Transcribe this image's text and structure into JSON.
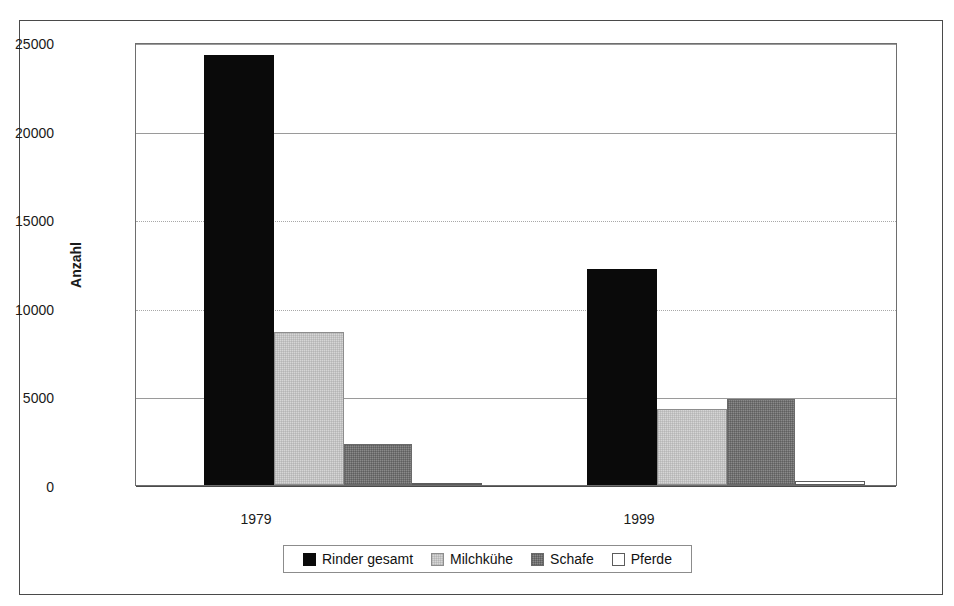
{
  "chart_data": {
    "type": "bar",
    "title": "",
    "subtitle": "",
    "xlabel": "",
    "ylabel": "Anzahl",
    "categories": [
      "1979",
      "1999"
    ],
    "series": [
      {
        "name": "Rinder gesamt",
        "values": [
          24400,
          12250
        ],
        "color": "#0a0a0a"
      },
      {
        "name": "Milchkühe",
        "values": [
          8650,
          4300
        ],
        "color": "#d6d6d6"
      },
      {
        "name": "Schafe",
        "values": [
          2300,
          4850
        ],
        "color": "#8a8a8a"
      },
      {
        "name": "Pferde",
        "values": [
          100,
          250
        ],
        "color": "#ffffff"
      }
    ],
    "ylim": [
      0,
      25000
    ],
    "ytick_labels": [
      "25000",
      "20000",
      "15000",
      "10000",
      "5000",
      "0"
    ],
    "ytick_values": [
      25000,
      20000,
      15000,
      10000,
      5000,
      0
    ],
    "grid": true,
    "grid_axis": "y",
    "legend_position": "bottom",
    "bar_grouping": "grouped"
  },
  "axes": {
    "y_title": "Anzahl",
    "y_ticks": [
      {
        "label": "25000",
        "value": 25000
      },
      {
        "label": "20000",
        "value": 20000
      },
      {
        "label": "15000",
        "value": 15000
      },
      {
        "label": "10000",
        "value": 10000
      },
      {
        "label": "5000",
        "value": 5000
      },
      {
        "label": "0",
        "value": 0
      }
    ],
    "x_ticks": [
      {
        "label": "1979"
      },
      {
        "label": "1999"
      }
    ]
  },
  "legend": {
    "items": [
      {
        "label": "Rinder gesamt",
        "swatch": "black-square-icon"
      },
      {
        "label": "Milchkühe",
        "swatch": "light-gray-square-icon"
      },
      {
        "label": "Schafe",
        "swatch": "dark-gray-square-icon"
      },
      {
        "label": "Pferde",
        "swatch": "white-square-icon"
      }
    ]
  },
  "bars": {
    "1979": {
      "rinder": "24400",
      "milch": "8650",
      "schafe": "2300",
      "pferde": "100"
    },
    "1999": {
      "rinder": "12250",
      "milch": "4300",
      "schafe": "4850",
      "pferde": "250"
    }
  }
}
